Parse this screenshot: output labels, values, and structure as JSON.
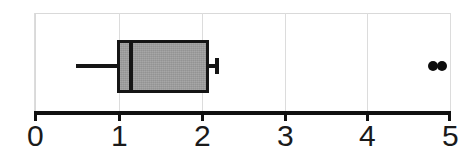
{
  "chart_data": {
    "type": "box",
    "title": "",
    "xlabel": "",
    "ylabel": "",
    "orientation": "horizontal",
    "xlim": [
      0,
      5
    ],
    "grid": true,
    "legend": null,
    "axis": {
      "ticks": [
        0,
        1,
        2,
        3,
        4,
        5
      ],
      "tick_labels": [
        "0",
        "1",
        "2",
        "3",
        "4",
        "5"
      ]
    },
    "boxes": [
      {
        "name": "series-1",
        "whisker_low": 0.5,
        "q1": 1.0,
        "median": 1.17,
        "q3": 2.1,
        "whisker_high": 2.2,
        "outliers": [
          4.8,
          4.9
        ],
        "fill_color": "#9e9e9e",
        "line_color": "#151515"
      }
    ],
    "colors": {
      "box_fill": "#9e9e9e",
      "box_edge": "#151515",
      "axis": "#111111",
      "grid": "#dcdcdc",
      "frame": "#d9d9d9",
      "outlier": "#0d0d0d",
      "background": "#ffffff"
    }
  },
  "axis_labels": {
    "t0": "0",
    "t1": "1",
    "t2": "2",
    "t3": "3",
    "t4": "4",
    "t5": "5"
  }
}
